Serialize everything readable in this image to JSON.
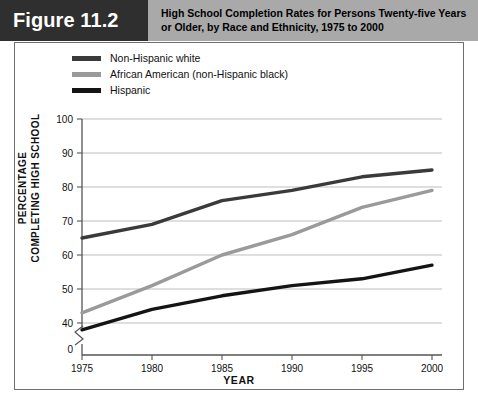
{
  "figure": {
    "tag": "Figure 11.2",
    "title": "High School Completion Rates for Persons Twenty-five Years or Older, by Race and Ethnicity, 1975 to 2000"
  },
  "colors": {
    "tag_background": "#2f2f2f",
    "title_background": "#a9a9a9",
    "frame_border": "#6f6f6f",
    "gridline": "#b5b5b5",
    "axis": "#555555",
    "series_non_hispanic_white": "#3a3a3a",
    "series_african_american": "#9a9a9a",
    "series_hispanic": "#141414"
  },
  "chart_data": {
    "type": "line",
    "title": "High School Completion Rates for Persons Twenty-five Years or Older, by Race and Ethnicity, 1975 to 2000",
    "xlabel": "YEAR",
    "ylabel": "PERCENTAGE COMPLETING HIGH SCHOOL",
    "ylabel_line1": "PERCENTAGE",
    "ylabel_line2": "COMPLETING HIGH SCHOOL",
    "x": [
      1975,
      1980,
      1985,
      1990,
      1995,
      2000
    ],
    "xtick_labels": [
      "1975",
      "1980",
      "1985",
      "1990",
      "1995",
      "2000"
    ],
    "ytick_labels": [
      "0",
      "40",
      "50",
      "60",
      "70",
      "80",
      "90",
      "100"
    ],
    "ylim": [
      40,
      100
    ],
    "ytick_values": [
      40,
      50,
      60,
      70,
      80,
      90,
      100
    ],
    "axis_break": true,
    "axis_break_label": "0",
    "grid": true,
    "legend_position": "above-plot-left",
    "series": [
      {
        "name": "Non-Hispanic white",
        "color": "#3a3a3a",
        "values": [
          65,
          69,
          76,
          79,
          83,
          85
        ]
      },
      {
        "name": "African American (non-Hispanic black)",
        "color": "#9a9a9a",
        "values": [
          43,
          51,
          60,
          66,
          74,
          79
        ]
      },
      {
        "name": "Hispanic",
        "color": "#141414",
        "values": [
          38,
          44,
          48,
          51,
          53,
          57
        ]
      }
    ]
  }
}
